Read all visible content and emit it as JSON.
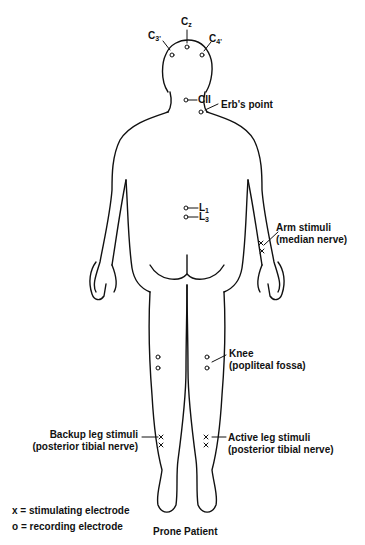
{
  "electrodes": {
    "c3": {
      "main": "C",
      "sub": "3'"
    },
    "cz": {
      "main": "C",
      "sub": "z"
    },
    "c4": {
      "main": "C",
      "sub": "4'"
    },
    "cii": "CII",
    "erbs_point": "Erb's point",
    "l1": {
      "main": "L",
      "sub": "1"
    },
    "l3": {
      "main": "L",
      "sub": "3"
    }
  },
  "labels": {
    "arm": {
      "line1": "Arm stimuli",
      "line2": "(median nerve)"
    },
    "knee": {
      "line1": "Knee",
      "line2": "(popliteal fossa)"
    },
    "backup_leg": {
      "line1": "Backup leg stimuli",
      "line2": "(posterior tibial nerve)"
    },
    "active_leg": {
      "line1": "Active leg stimuli",
      "line2": "(posterior tibial nerve)"
    }
  },
  "legend": {
    "stimulating": "x = stimulating electrode",
    "recording": "o = recording electrode"
  },
  "caption": "Prone Patient",
  "colors": {
    "ink": "#111111",
    "background": "#ffffff"
  }
}
